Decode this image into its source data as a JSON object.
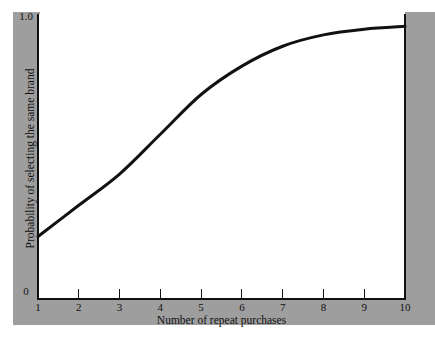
{
  "figure": {
    "background_color": "#ffffff",
    "band_color": "#9e9e9e",
    "line_color": "#111111"
  },
  "axes": {
    "y_tick_top": "1.0",
    "y_tick_bottom": "0",
    "y_title": "Probability of selecting the same brand",
    "x_title": "Number of repeat purchases",
    "x_tick_labels": [
      "1",
      "2",
      "3",
      "4",
      "5",
      "6",
      "7",
      "8",
      "9",
      "10"
    ]
  },
  "chart_data": {
    "type": "line",
    "title": "",
    "xlabel": "Number of repeat purchases",
    "ylabel": "Probability of selecting the same brand",
    "xlim": [
      1,
      10
    ],
    "ylim": [
      0,
      1.0
    ],
    "xticks": [
      1,
      2,
      3,
      4,
      5,
      6,
      7,
      8,
      9,
      10
    ],
    "xticklabels": [
      "1",
      "2",
      "3",
      "4",
      "5",
      "6",
      "7",
      "8",
      "9",
      "10"
    ],
    "yticks": [
      0,
      1.0
    ],
    "yticklabels": [
      "0",
      "1.0"
    ],
    "grid": false,
    "legend": false,
    "series": [
      {
        "name": "Probability of selecting the same brand",
        "x": [
          1,
          2,
          3,
          4,
          5,
          6,
          7,
          8,
          9,
          10
        ],
        "values": [
          0.22,
          0.33,
          0.44,
          0.58,
          0.72,
          0.82,
          0.89,
          0.93,
          0.95,
          0.96
        ]
      }
    ]
  }
}
